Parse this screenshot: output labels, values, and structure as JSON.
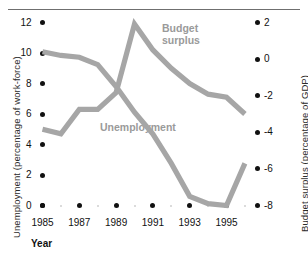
{
  "figure": {
    "top_rule": true,
    "background": "#ffffff",
    "line_color": "#a6a6a6",
    "tick_color": "#111111",
    "label_color": "#9a9a9a"
  },
  "chart_data": {
    "type": "line",
    "title": "",
    "xlabel": "Year",
    "ylabel": "Unemployment (percentage of work-force)",
    "y2label": "Budget surplus (percentage of GDP)",
    "grid": false,
    "legend_position": "inline-annotations",
    "x": [
      1985,
      1986,
      1987,
      1988,
      1989,
      1990,
      1991,
      1992,
      1993,
      1994,
      1995,
      1996
    ],
    "xticks": [
      "1985",
      "1987",
      "1989",
      "1991",
      "1993",
      "1995"
    ],
    "xtick_values": [
      1985,
      1987,
      1989,
      1991,
      1993,
      1995
    ],
    "xlim": [
      1985,
      1996
    ],
    "yticks": [
      "0",
      "2",
      "4",
      "6",
      "8",
      "10",
      "12"
    ],
    "ytick_values": [
      0,
      2,
      4,
      6,
      8,
      10,
      12
    ],
    "ylim": [
      0,
      12
    ],
    "y2ticks": [
      "-8",
      "-6",
      "-4",
      "-2",
      "0",
      "2"
    ],
    "y2tick_values": [
      -8,
      -6,
      -4,
      -2,
      0,
      2
    ],
    "y2lim": [
      -8,
      2
    ],
    "series": [
      {
        "name": "Unemployment",
        "axis": "left",
        "annotation": "Unemployment",
        "values": [
          5.0,
          4.7,
          6.3,
          6.3,
          7.4,
          11.9,
          10.2,
          9.0,
          8.0,
          7.3,
          7.1,
          6.0
        ]
      },
      {
        "name": "Budget surplus",
        "axis": "right",
        "annotation": "Budget\nsurplus",
        "values": [
          0.4,
          0.2,
          0.1,
          -0.3,
          -1.5,
          -2.9,
          -4.1,
          -5.7,
          -7.5,
          -7.9,
          -8.0,
          -5.7
        ]
      }
    ]
  },
  "annotations": {
    "budget_surplus": "Budget\nsurplus",
    "unemployment": "Unemployment"
  },
  "axes": {
    "x_title": "Year",
    "y_left_title": "Unemployment (percentage of work-force)",
    "y_right_title": "Budget surplus (percentage of GDP)"
  }
}
